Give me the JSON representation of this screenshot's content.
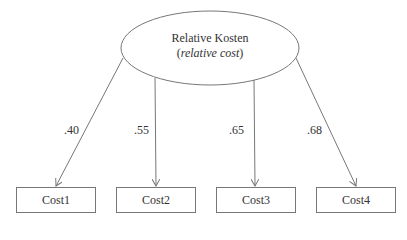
{
  "diagram": {
    "latent": {
      "label": "Relative Kosten",
      "translation_open": "(",
      "translation": "relative cost",
      "translation_close": ")"
    },
    "indicators": [
      {
        "label": "Cost1",
        "loading": ".40"
      },
      {
        "label": "Cost2",
        "loading": ".55"
      },
      {
        "label": "Cost3",
        "loading": ".65"
      },
      {
        "label": "Cost4",
        "loading": ".68"
      }
    ],
    "colors": {
      "stroke": "#777777",
      "text": "#333333"
    }
  }
}
